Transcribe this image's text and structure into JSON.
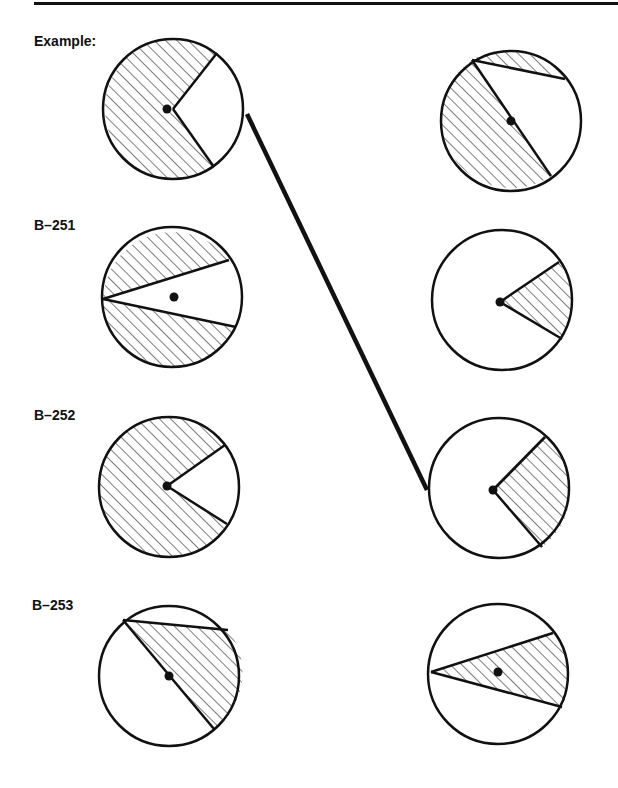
{
  "labels": {
    "example": "Example:",
    "b251": "B–251",
    "b252": "B–252",
    "b253": "B–253"
  },
  "colors": {
    "ink": "#111111",
    "background": "#ffffff"
  },
  "rows": [
    {
      "id": "example",
      "label": "Example:",
      "left_circle": "shaded-except-right-sector",
      "right_circle": "shaded-left-half-and-top-segment"
    },
    {
      "id": "B-251",
      "label": "B–251",
      "left_circle": "shaded-top-and-bottom-segments",
      "right_circle": "shaded-right-sector"
    },
    {
      "id": "B-252",
      "label": "B–252",
      "left_circle": "shaded-except-right-sector",
      "right_circle": "shaded-right-sector"
    },
    {
      "id": "B-253",
      "label": "B–253",
      "left_circle": "shaded-right-triangle-region",
      "right_circle": "shaded-wedge-through-center"
    }
  ],
  "connection": {
    "from": "example-left-circle",
    "to": "B-252-right-circle"
  }
}
